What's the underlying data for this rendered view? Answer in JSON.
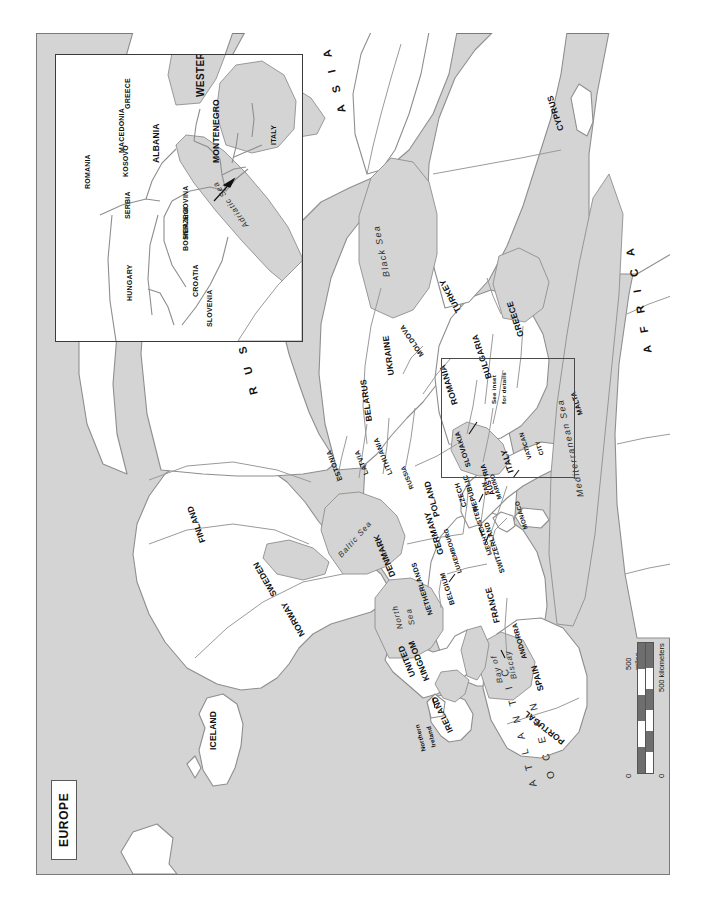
{
  "map": {
    "title": "EUROPE",
    "inset_note": "See inset for details",
    "inset_title": "WESTERN BALKANS"
  },
  "scale": {
    "miles_label": "500 miles",
    "kilometers_label": "500 kilometers",
    "zero_top": "0",
    "zero_bottom": "0"
  },
  "countries": [
    {
      "name": "ICELAND"
    },
    {
      "name": "NORWAY"
    },
    {
      "name": "SWEDEN"
    },
    {
      "name": "FINLAND"
    },
    {
      "name": "ESTONIA"
    },
    {
      "name": "LATVIA"
    },
    {
      "name": "LITHUANIA"
    },
    {
      "name": "RUSSIA"
    },
    {
      "name": "BELARUS"
    },
    {
      "name": "UKRAINE"
    },
    {
      "name": "MOLDOVA"
    },
    {
      "name": "POLAND"
    },
    {
      "name": "DENMARK"
    },
    {
      "name": "GERMANY"
    },
    {
      "name": "NETHERLANDS"
    },
    {
      "name": "BELGIUM"
    },
    {
      "name": "LUXEMBOURG"
    },
    {
      "name": "CZECH REPUBLIC"
    },
    {
      "name": "SLOVAKIA"
    },
    {
      "name": "AUSTRIA"
    },
    {
      "name": "LIECHTENSTEIN"
    },
    {
      "name": "SWITZERLAND"
    },
    {
      "name": "FRANCE"
    },
    {
      "name": "MONACO"
    },
    {
      "name": "SAN MARINO"
    },
    {
      "name": "ITALY"
    },
    {
      "name": "VATICAN CITY"
    },
    {
      "name": "MALTA"
    },
    {
      "name": "ANDORRA"
    },
    {
      "name": "SPAIN"
    },
    {
      "name": "PORTUGAL"
    },
    {
      "name": "UNITED KINGDOM"
    },
    {
      "name": "IRELAND"
    },
    {
      "name": "Northern Ireland"
    },
    {
      "name": "ROMANIA"
    },
    {
      "name": "BULGARIA"
    },
    {
      "name": "GREECE"
    },
    {
      "name": "TURKEY"
    },
    {
      "name": "CYPRUS"
    }
  ],
  "regions": [
    {
      "name": "RUSSIA"
    },
    {
      "name": "ASIA"
    },
    {
      "name": "AFRICA"
    }
  ],
  "water_bodies": [
    {
      "name": "ATLANTIC OCEAN"
    },
    {
      "name": "North Sea"
    },
    {
      "name": "Baltic Sea"
    },
    {
      "name": "Bay of Biscay"
    },
    {
      "name": "Mediterranean Sea"
    },
    {
      "name": "Black Sea"
    },
    {
      "name": "Caspian Sea"
    },
    {
      "name": "Adriatic Sea"
    }
  ],
  "labels": {
    "iceland": "ICELAND",
    "norway": "NORWAY",
    "sweden": "SWEDEN",
    "finland": "FINLAND",
    "estonia": "ESTONIA",
    "latvia": "LATVIA",
    "lithuania": "LITHUANIA",
    "russia_kaliningrad": "RUSSIA",
    "belarus": "BELARUS",
    "ukraine": "UKRAINE",
    "moldova": "MOLDOVA",
    "poland": "POLAND",
    "denmark": "DENMARK",
    "germany": "GERMANY",
    "netherlands": "NETHERLANDS",
    "belgium": "BELGIUM",
    "luxembourg": "LUXEMBOURG",
    "czech1": "CZECH",
    "czech2": "REPUBLIC",
    "slovakia": "SLOVAKIA",
    "austria": "AUSTRIA",
    "liechtenstein": "LIECHTENSTEIN",
    "switzerland": "SWITZERLAND",
    "france": "FRANCE",
    "monaco": "MONACO",
    "sanmarino1": "SAN",
    "sanmarino2": "MARINO",
    "italy": "ITALY",
    "vatican1": "VATICAN",
    "vatican2": "CITY",
    "malta": "MALTA",
    "andorra": "ANDORRA",
    "spain": "SPAIN",
    "portugal": "PORTUGAL",
    "uk1": "UNITED",
    "uk2": "KINGDOM",
    "ireland": "IRELAND",
    "nireland1": "Northern",
    "nireland2": "Ireland",
    "romania": "ROMANIA",
    "bulgaria": "BULGARIA",
    "greece": "GREECE",
    "turkey": "TURKEY",
    "cyprus": "CYPRUS",
    "russia_big": "R U S S I A",
    "asia": "A S I A",
    "africa": "A F R I C A",
    "atlantic1": "A T L A N T I C",
    "atlantic2": "O C E A N",
    "north_sea1": "North",
    "north_sea2": "Sea",
    "baltic_sea": "Baltic Sea",
    "bay_biscay1": "Bay of",
    "bay_biscay2": "Biscay",
    "mediterranean": "Mediterranean Sea",
    "black_sea": "Black Sea",
    "caspian_sea": "Caspian Sea",
    "inset_note1": "See inset",
    "inset_note2": "for details"
  },
  "inset": {
    "title": "WESTERN BALKANS",
    "labels": {
      "slovenia": "SLOVENIA",
      "croatia": "CROATIA",
      "hungary": "HUNGARY",
      "romania": "ROMANIA",
      "bosnia1": "BOSNIA and",
      "bosnia2": "HERZEGOVINA",
      "serbia": "SERBIA",
      "kosovo": "KOSOVO",
      "macedonia": "MACEDONIA",
      "albania": "ALBANIA",
      "montenegro": "MONTENEGRO",
      "greece": "GREECE",
      "italy": "ITALY",
      "adriatic": "Adriatic Sea"
    }
  },
  "colors": {
    "water": "#d4d4d4",
    "land": "#ffffff",
    "border": "#8e8e8e",
    "text": "#111111",
    "frame": "#7a7a7a",
    "scale_dark": "#6e6e6e"
  }
}
